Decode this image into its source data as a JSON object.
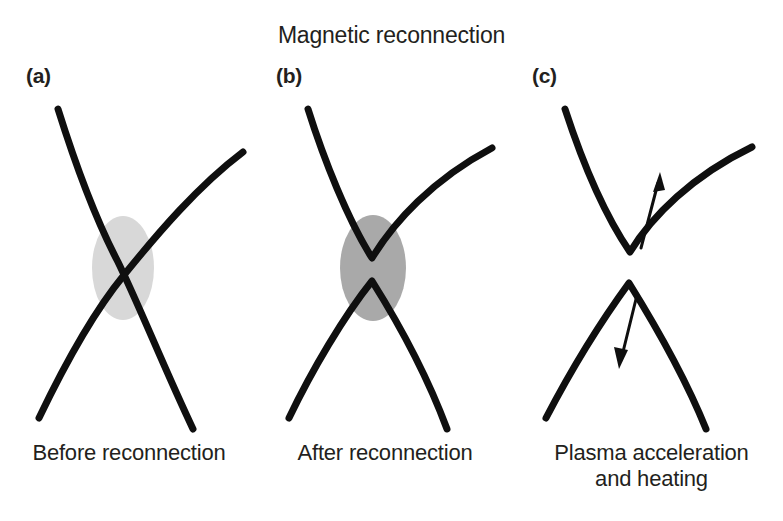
{
  "figure": {
    "title": "Magnetic reconnection",
    "background_color": "#ffffff",
    "line_color": "#0f0f0f",
    "text_color": "#231f20"
  },
  "panels": [
    {
      "label": "(a)",
      "caption": "Before reconnection",
      "state": "pre-reconnection",
      "diffusion_region": {
        "shown": true,
        "shape": "ellipse",
        "fill": "#d8d8d8",
        "cx": 123,
        "cy": 268,
        "rx": 31,
        "ry": 52
      },
      "field_lines": [
        {
          "name": "field-line-descending",
          "orientation": "top-left-to-bottom-right"
        },
        {
          "name": "field-line-ascending",
          "orientation": "bottom-left-to-top-right"
        }
      ],
      "arrows": []
    },
    {
      "label": "(b)",
      "caption": "After reconnection",
      "state": "post-reconnection",
      "diffusion_region": {
        "shown": true,
        "shape": "ellipse",
        "fill": "#a9a9a9",
        "cx": 373,
        "cy": 268,
        "rx": 33,
        "ry": 53
      },
      "field_lines": [
        {
          "name": "field-line-upper-v",
          "orientation": "v-shaped-cusp-upward-open"
        },
        {
          "name": "field-line-lower-lambda",
          "orientation": "lambda-shaped-cusp-downward-open"
        }
      ],
      "arrows": []
    },
    {
      "label": "(c)",
      "caption": "Plasma acceleration\nand heating",
      "state": "outflow",
      "diffusion_region": {
        "shown": false
      },
      "field_lines": [
        {
          "name": "field-line-upper-v",
          "orientation": "v-shaped-cusp-upward-open"
        },
        {
          "name": "field-line-lower-lambda",
          "orientation": "lambda-shaped-cusp-downward-open"
        }
      ],
      "arrows": [
        {
          "name": "outflow-arrow-up",
          "direction": "up",
          "meaning": "plasma outflow jet upward"
        },
        {
          "name": "outflow-arrow-down",
          "direction": "down",
          "meaning": "plasma outflow jet downward"
        }
      ]
    }
  ]
}
